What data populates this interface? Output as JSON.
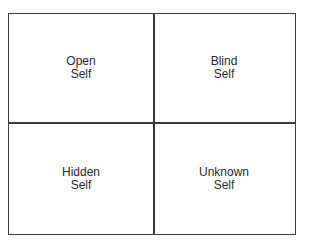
{
  "diagram": {
    "type": "johari-window",
    "quadrants": [
      {
        "line1": "Open",
        "line2": "Self"
      },
      {
        "line1": "Blind",
        "line2": "Self"
      },
      {
        "line1": "Hidden",
        "line2": "Self"
      },
      {
        "line1": "Unknown",
        "line2": "Self"
      }
    ],
    "colors": {
      "border": "#3a3a3a",
      "text": "#2a2a2a",
      "background": "#ffffff"
    }
  }
}
